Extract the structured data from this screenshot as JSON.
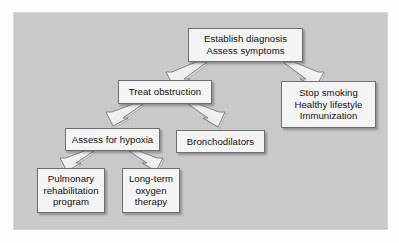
{
  "figure": {
    "type": "flowchart",
    "orientation": "top-down",
    "background_color": "#c8c8c8",
    "node_fill_color": "#f4f4f4",
    "node_border_color": "#6e6e6e",
    "text_color": "#111111",
    "arrow_style": "3d-block-arrow"
  },
  "nodes": {
    "establish": {
      "id": "establish",
      "lines": [
        "Establish diagnosis",
        "Assess symptoms"
      ],
      "line1": "Establish diagnosis",
      "line2": "Assess symptoms",
      "level": 1
    },
    "treat": {
      "id": "treat",
      "lines": [
        "Treat obstruction"
      ],
      "line1": "Treat obstruction",
      "level": 2
    },
    "prevention": {
      "id": "prevention",
      "lines": [
        "Stop smoking",
        "Healthy lifestyle",
        "Immunization"
      ],
      "line1": "Stop smoking",
      "line2": "Healthy lifestyle",
      "line3": "Immunization",
      "level": 2
    },
    "hypoxia": {
      "id": "hypoxia",
      "lines": [
        "Assess for hypoxia"
      ],
      "line1": "Assess for hypoxia",
      "level": 3
    },
    "bronchodilators": {
      "id": "bronchodilators",
      "lines": [
        "Bronchodilators"
      ],
      "line1": "Bronchodilators",
      "level": 3
    },
    "pulmonary": {
      "id": "pulmonary",
      "lines": [
        "Pulmonary",
        "rehabilitation",
        "program"
      ],
      "line1": "Pulmonary",
      "line2": "rehabilitation",
      "line3": "program",
      "level": 4
    },
    "oxygen": {
      "id": "oxygen",
      "lines": [
        "Long-term",
        "oxygen",
        "therapy"
      ],
      "line1": "Long-term",
      "line2": "oxygen",
      "line3": "therapy",
      "level": 4
    }
  },
  "edges": [
    {
      "from": "establish",
      "to": "treat",
      "direction": "down-left"
    },
    {
      "from": "establish",
      "to": "prevention",
      "direction": "down-right"
    },
    {
      "from": "treat",
      "to": "hypoxia",
      "direction": "down-left"
    },
    {
      "from": "treat",
      "to": "bronchodilators",
      "direction": "down-right"
    },
    {
      "from": "hypoxia",
      "to": "pulmonary",
      "direction": "down-left"
    },
    {
      "from": "hypoxia",
      "to": "oxygen",
      "direction": "down-right"
    }
  ]
}
